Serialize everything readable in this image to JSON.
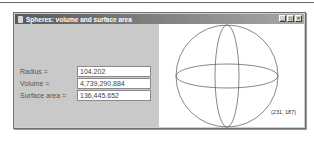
{
  "window": {
    "title": "Spheres: volume and surface area",
    "buttons": {
      "minimize": "_",
      "maximize": "□",
      "close": "×"
    }
  },
  "form": {
    "fields": [
      {
        "label": "Radius =",
        "value": "104.202"
      },
      {
        "label": "Volume =",
        "value": "4,739,290.884"
      },
      {
        "label": "Surface area =",
        "value": "136,445.652"
      }
    ]
  },
  "canvas": {
    "drawing": "sphere-wireframe",
    "coordinate_label": "(231, 187)",
    "colors": {
      "stroke": "#555555",
      "background": "#ffffff"
    }
  },
  "colors": {
    "panel": "#c9c9c9",
    "titlebar_start": "#5a5a5a",
    "titlebar_end": "#a8a8a8"
  }
}
